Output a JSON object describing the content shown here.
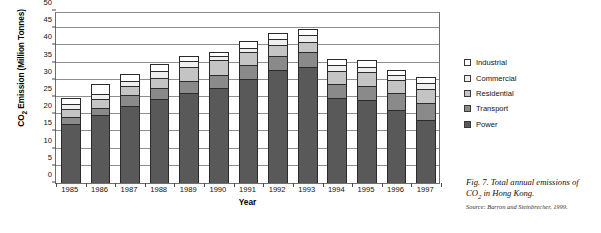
{
  "chart_data": {
    "type": "bar",
    "stacked": true,
    "title": "",
    "xlabel": "Year",
    "ylabel": "CO2 Emission (Million Tonnes)",
    "ylabel_parts": {
      "prefix": "CO",
      "sub": "2",
      "suffix": " Emission (Million Tonnes)"
    },
    "ylim": [
      0,
      50
    ],
    "ytick_step": 5,
    "ytick_labels": [
      "0",
      "5",
      "10",
      "15",
      "20",
      "25",
      "30",
      "35",
      "40",
      "45",
      "50"
    ],
    "grid": true,
    "grid_axis": "y",
    "legend_position": "right",
    "categories": [
      "1985",
      "1986",
      "1987",
      "1988",
      "1989",
      "1990",
      "1991",
      "1992",
      "1993",
      "1994",
      "1995",
      "1996",
      "1997"
    ],
    "series": [
      {
        "name": "Power",
        "color": "#595959",
        "values": [
          17.3,
          19.7,
          22.5,
          24.3,
          26.1,
          27.7,
          30.3,
          32.9,
          33.7,
          24.7,
          24.0,
          21.2,
          18.3
        ]
      },
      {
        "name": "Transport",
        "color": "#8a8a8a",
        "values": [
          2.0,
          2.2,
          3.1,
          3.2,
          3.6,
          3.8,
          4.1,
          4.1,
          4.3,
          4.2,
          4.3,
          5.0,
          5.1
        ]
      },
      {
        "name": "Residential",
        "color": "#c4c4c4",
        "values": [
          2.1,
          2.4,
          2.5,
          3.1,
          4.1,
          4.4,
          3.7,
          3.1,
          2.9,
          3.6,
          3.9,
          3.8,
          4.0
        ]
      },
      {
        "name": "Commercial",
        "color": "#efefef",
        "values": [
          1.5,
          1.5,
          1.6,
          1.9,
          1.7,
          1.0,
          1.2,
          1.9,
          2.0,
          1.9,
          1.6,
          1.4,
          1.7
        ]
      },
      {
        "name": "Industrial",
        "color": "#ffffff",
        "values": [
          1.8,
          2.9,
          2.0,
          2.0,
          1.5,
          1.2,
          2.0,
          1.7,
          2.0,
          1.7,
          2.1,
          1.6,
          1.7
        ]
      }
    ],
    "totals": [
      24.7,
      28.7,
      31.7,
      34.5,
      37.0,
      38.1,
      41.3,
      43.7,
      44.9,
      36.1,
      35.9,
      33.0,
      30.8
    ],
    "legend_order_top_to_bottom": [
      "Industrial",
      "Commercial",
      "Residential",
      "Transport",
      "Power"
    ]
  },
  "caption": {
    "figure_label": "Fig. 7.",
    "text_prefix": "Fig. 7. Total annual emissions of CO",
    "text_sub": "2",
    "text_suffix": " in Hong Kong.",
    "source": "Source: Barron and Steinbrecher, 1999."
  }
}
